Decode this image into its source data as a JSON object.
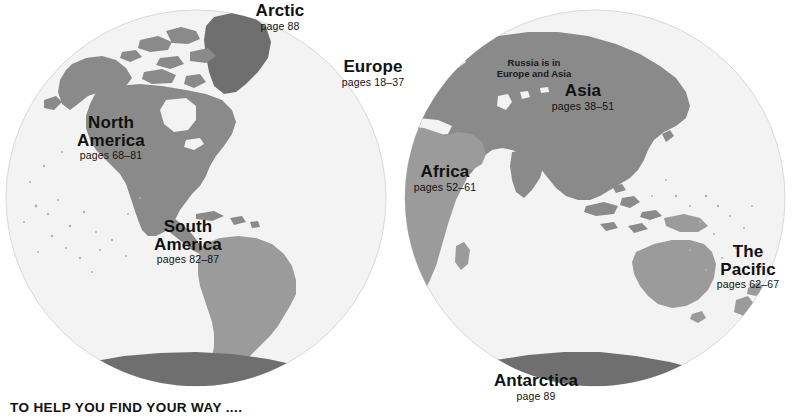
{
  "page": {
    "caption": "TO HELP YOU FIND YOUR WAY ....",
    "background_color": "#ffffff"
  },
  "colors": {
    "ocean": "#f3f3f3",
    "ocean_edge": "#d8d8d8",
    "land_light": "#9b9b9b",
    "land_mid": "#8a8a8a",
    "land_dark": "#6f6f6f",
    "text": "#111111"
  },
  "map": {
    "projection": "two-hemisphere-globes",
    "hemispheres": [
      {
        "name": "western-hemisphere",
        "cx": 196,
        "cy": 198,
        "rx": 190,
        "ry": 188
      },
      {
        "name": "eastern-hemisphere",
        "cx": 595,
        "cy": 198,
        "rx": 190,
        "ry": 188
      }
    ]
  },
  "labels": [
    {
      "id": "arctic",
      "name": "Arctic",
      "name2": "",
      "pages": "page 88"
    },
    {
      "id": "north-america",
      "name": "North",
      "name2": "America",
      "pages": "pages 68–81"
    },
    {
      "id": "south-america",
      "name": "South",
      "name2": "America",
      "pages": "pages 82–87"
    },
    {
      "id": "europe",
      "name": "Europe",
      "name2": "",
      "pages": "pages 18–37"
    },
    {
      "id": "asia",
      "name": "Asia",
      "name2": "",
      "pages": "pages 38–51"
    },
    {
      "id": "africa",
      "name": "Africa",
      "name2": "",
      "pages": "pages 52–61"
    },
    {
      "id": "pacific",
      "name": "The",
      "name2": "Pacific",
      "pages": "pages 62–67"
    },
    {
      "id": "antarctica",
      "name": "Antarctica",
      "name2": "",
      "pages": "page 89"
    }
  ],
  "annotations": [
    {
      "id": "russia",
      "line1": "Russia is in",
      "line2": "Europe and Asia"
    }
  ]
}
